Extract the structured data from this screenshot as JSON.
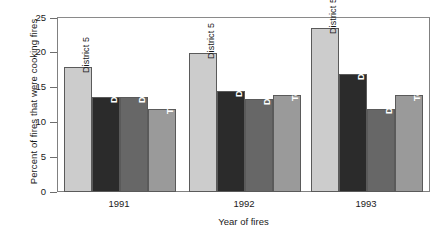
{
  "chart_data": {
    "type": "bar",
    "title": "",
    "xlabel": "Year of fires",
    "ylabel": "Percent of fires that were cooking fires",
    "categories": [
      "1991",
      "1992",
      "1993"
    ],
    "ylim": [
      0,
      25
    ],
    "yticks": [
      0,
      5,
      10,
      15,
      20,
      25
    ],
    "ytick_labels": [
      "0",
      "5",
      "10",
      "15",
      "20",
      "25"
    ],
    "grid": false,
    "legend": "none (bars labeled in place)",
    "series": [
      {
        "name": "District 5",
        "color": "#cccccc",
        "text_color": "#1a1a1a",
        "values": [
          18.0,
          20.0,
          23.5
        ]
      },
      {
        "name": "District 8",
        "color": "#2b2b2b",
        "text_color": "#ffffff",
        "values": [
          13.7,
          14.5,
          17.0
        ]
      },
      {
        "name": "District 13",
        "color": "#676767",
        "text_color": "#ffffff",
        "values": [
          13.7,
          13.3,
          12.0
        ]
      },
      {
        "name": "Total city",
        "color": "#9a9a9a",
        "text_color": "#ffffff",
        "values": [
          12.0,
          13.9,
          14.0
        ]
      }
    ]
  },
  "axis": {
    "y_title": "Percent of fires that were cooking fires",
    "x_title": "Year of fires",
    "y_tick_0": "0",
    "y_tick_5": "5",
    "y_tick_10": "10",
    "y_tick_15": "15",
    "y_tick_20": "20",
    "y_tick_25": "25",
    "x_tick_1": "1991",
    "x_tick_2": "1992",
    "x_tick_3": "1993"
  },
  "bar_labels": {
    "g1b1": "District 5",
    "g1b2": "District 8",
    "g1b3": "District 13",
    "g1b4": "Total city",
    "g2b1": "District 5",
    "g2b2": "District 8",
    "g2b3": "District 13",
    "g2b4": "Total city",
    "g3b1": "District 5",
    "g3b2": "District 8",
    "g3b3": "District 13",
    "g3b4": "Total city"
  }
}
